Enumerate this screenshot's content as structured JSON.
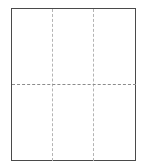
{
  "diagram": {
    "canvas": {
      "width": 146,
      "height": 162,
      "background_color": "#ffffff"
    },
    "frame": {
      "name": "page-outline",
      "x": 11,
      "y": 8,
      "width": 125,
      "height": 153,
      "stroke_color": "#4a4a4a",
      "stroke_width": 1,
      "stroke_style": "solid",
      "fill_color": "#ffffff"
    },
    "guides": {
      "stroke_style": "dashed",
      "vertical": [
        {
          "name": "vertical-guide-left",
          "x": 52,
          "y_start": 9,
          "y_end": 161,
          "color": "#b4b4b4"
        },
        {
          "name": "vertical-guide-right",
          "x": 93,
          "y_start": 9,
          "y_end": 161,
          "color": "#b4b4b4"
        }
      ],
      "horizontal": [
        {
          "name": "horizontal-guide-middle",
          "y": 84,
          "x_start": 12,
          "x_end": 136,
          "color": "#8c8c8c"
        }
      ]
    },
    "grid": {
      "columns": 3,
      "rows": 2,
      "cells": 6
    }
  }
}
